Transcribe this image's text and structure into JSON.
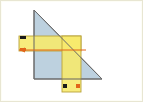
{
  "figure": {
    "width": 143,
    "height": 102,
    "background_color": "#ffffff",
    "frame_color": "#e8e6d2"
  },
  "colors": {
    "triangle_fill": "#b9cfdd",
    "triangle_stroke": "#6b6b6b",
    "rect_fill": "#f7e96b",
    "rect_stroke": "#b9a33a",
    "arrow_line": "#e2651a",
    "tick_black": "#1a1a1a",
    "tick_orange": "#e2651a"
  },
  "shapes": {
    "triangle": {
      "name": "right-triangle",
      "fill": "#b9cfdd",
      "stroke": "#6b6b6b",
      "points": "34,10 34,79 102,79",
      "apex": [
        34,
        10
      ],
      "right_angle_vertex": [
        34,
        79
      ],
      "base_right_vertex": [
        102,
        79
      ]
    },
    "horizontal_rect": {
      "name": "horizontal-yellow-band",
      "fill": "#f7e96b",
      "stroke": "#b9a33a",
      "x": 19,
      "y": 36,
      "width": 62,
      "height": 15
    },
    "vertical_rect": {
      "name": "vertical-yellow-band",
      "fill": "#f7e96b",
      "stroke": "#b9a33a",
      "x": 62,
      "y": 36,
      "width": 19,
      "height": 56
    }
  },
  "annotations": {
    "horizontal_arrow": {
      "name": "horizontal-measure-arrow",
      "color": "#e2651a",
      "x1": 19,
      "y1": 50,
      "x2": 86,
      "y2": 50,
      "arrowhead": "left"
    },
    "tick_top_left": {
      "name": "tick-top-left-black",
      "color": "#1a1a1a",
      "x": 20,
      "y": 36,
      "width": 6,
      "height": 3
    },
    "tick_bottom_left": {
      "name": "tick-bottom-left-orange",
      "color": "#e2651a",
      "x": 20,
      "y": 48,
      "width": 6,
      "height": 3
    },
    "tick_bottom_rect_left": {
      "name": "tick-bottom-rect-left-black",
      "color": "#1a1a1a",
      "x": 63,
      "y": 84,
      "width": 4,
      "height": 4
    },
    "tick_bottom_rect_right": {
      "name": "tick-bottom-rect-right-orange",
      "color": "#e2651a",
      "x": 76,
      "y": 84,
      "width": 4,
      "height": 4
    }
  },
  "labels": {
    "none_visible": ""
  }
}
